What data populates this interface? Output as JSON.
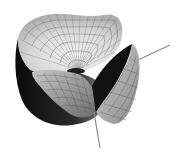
{
  "image": {
    "description": "3D rendered mathematical surface with wireframe mesh, grayscale shading, with two axis lines protruding",
    "background": "#ffffff",
    "colors": {
      "light_surface": "#e8e8e8",
      "mid_surface": "#a0a0a0",
      "dark_surface": "#1a1a1a",
      "mesh_lines": "#555555",
      "axis": "#888888"
    }
  }
}
